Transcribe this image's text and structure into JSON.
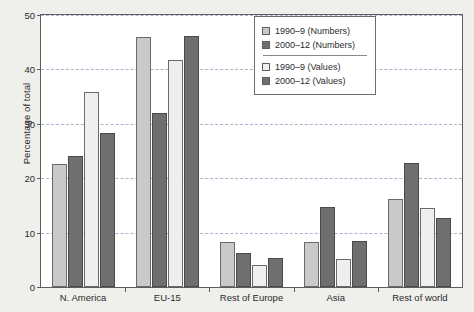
{
  "chart_data": {
    "type": "bar",
    "title": "",
    "xlabel": "",
    "ylabel": "Percentage of total",
    "ylim": [
      0,
      50
    ],
    "yticks": [
      0,
      10,
      20,
      30,
      40,
      50
    ],
    "grid": true,
    "legend_position": "top-right",
    "categories": [
      "N. America",
      "EU-15",
      "Rest of Europe",
      "Asia",
      "Rest of world"
    ],
    "series": [
      {
        "name": "1990–9 (Numbers)",
        "color": "#c9c9c9",
        "values": [
          22.7,
          46.0,
          8.3,
          8.2,
          16.2
        ]
      },
      {
        "name": "2000–12 (Numbers)",
        "color": "#6f6f6f",
        "values": [
          24.0,
          32.0,
          6.3,
          14.8,
          22.8
        ]
      },
      {
        "name": "1990–9 (Values)",
        "color": "#efefef",
        "values": [
          35.9,
          41.8,
          4.1,
          5.1,
          14.5
        ]
      },
      {
        "name": "2000–12 (Values)",
        "color": "#6f6f6f",
        "values": [
          28.4,
          46.2,
          5.4,
          8.4,
          12.7
        ]
      }
    ]
  },
  "axis": {
    "y_title": "Percentage of total",
    "y_tick_labels": [
      "0",
      "10",
      "20",
      "30",
      "40",
      "50"
    ],
    "x_tick_labels": [
      "N. America",
      "EU-15",
      "Rest of Europe",
      "Asia",
      "Rest of world"
    ]
  },
  "legend": {
    "entries": [
      {
        "label": "1990–9 (Numbers)",
        "swatch": "light-gray-swatch"
      },
      {
        "label": "2000–12 (Numbers)",
        "swatch": "dark-gray-swatch"
      },
      {
        "label": "1990–9 (Values)",
        "swatch": "white-swatch"
      },
      {
        "label": "2000–12 (Values)",
        "swatch": "dark-gray-swatch"
      }
    ]
  },
  "colors": {
    "numbers_1990": "#c9c9c9",
    "numbers_2000": "#6f6f6f",
    "values_1990": "#efefef",
    "values_2000": "#6f6f6f",
    "grid": "#9aa7c4",
    "frame": "#5d5d5d",
    "page_background": "#efefeb",
    "plot_background": "#ffffff"
  }
}
